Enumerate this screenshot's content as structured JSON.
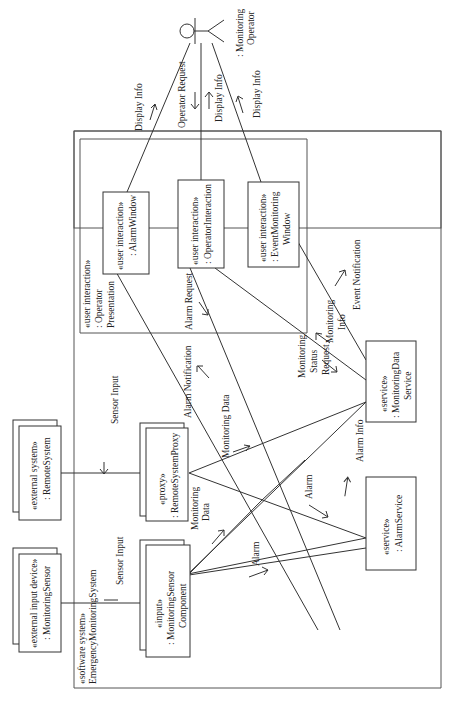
{
  "diagram": {
    "type": "UML communication diagram (rotated 90°)",
    "system": {
      "stereotype": "«software system»",
      "name": "EmergencyMonitoringSystem"
    },
    "actor": {
      "line1": ": Monitoring",
      "line2": "Operator"
    },
    "presentation": {
      "stereotype": "«user interaction»",
      "line1": ": Operator",
      "line2": "Presentation"
    },
    "objects": {
      "alarm_window": {
        "stereotype": "«user interaction»",
        "name": ": AlarmWindow"
      },
      "operator_interaction": {
        "stereotype": "«user interaction»",
        "name": ": OperatorInteraction"
      },
      "event_window": {
        "stereotype": "«user interaction»",
        "name1": ": EventMonitoring",
        "name2": "Window"
      },
      "remote_system": {
        "stereotype": "«external system»",
        "name": ": RemoteSystem"
      },
      "monitoring_sensor": {
        "stereotype": "«external input device»",
        "name": ": MonitoringSensor"
      },
      "proxy": {
        "stereotype": "«proxy»",
        "name": ": RemoteSystemProxy"
      },
      "sensor_component": {
        "stereotype": "«input»",
        "name1": ": MonitoringSensor",
        "name2": "Component"
      },
      "monitoring_service": {
        "stereotype": "«service»",
        "name1": ": MonitoringData",
        "name2": "Service"
      },
      "alarm_service": {
        "stereotype": "«service»",
        "name": ": AlarmService"
      }
    },
    "messages": {
      "display_info_1": "Display Info",
      "operator_request": "Operator Request",
      "display_info_2": "Display Info",
      "display_info_3": "Display Info",
      "sensor_input_1": "Sensor Input",
      "sensor_input_2": "Sensor Input",
      "alarm_notification": "Alarm Notification",
      "monitoring_data_1": "Monitoring Data",
      "monitoring_data_2a": "Monitoring",
      "monitoring_data_2b": "Data",
      "alarm_1": "Alarm",
      "alarm_2": "Alarm",
      "alarm_request": "Alarm Request",
      "monitoring_status_1": "Monitoring",
      "monitoring_status_2": "Status",
      "monitoring_status_3": "Request",
      "monitoring_info_1": "Monitoring",
      "monitoring_info_2": "Info",
      "event_notification": "Event Notification",
      "alarm_info": "Alarm Info"
    }
  }
}
